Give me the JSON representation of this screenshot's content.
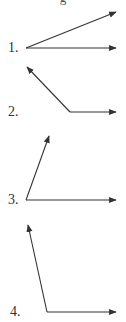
{
  "header": {
    "fragment": "g"
  },
  "diagrams": [
    {
      "label": "1.",
      "label_pos": [
        8,
        41
      ],
      "vertex": [
        26,
        48
      ],
      "ray_a": [
        116,
        12
      ],
      "ray_b": [
        116,
        48
      ]
    },
    {
      "label": "2.",
      "label_pos": [
        8,
        105
      ],
      "vertex": [
        70,
        112
      ],
      "ray_a": [
        27,
        67
      ],
      "ray_b": [
        116,
        112
      ]
    },
    {
      "label": "3.",
      "label_pos": [
        8,
        193
      ],
      "vertex": [
        26,
        200
      ],
      "ray_a": [
        49,
        136
      ],
      "ray_b": [
        116,
        200
      ]
    },
    {
      "label": "4.",
      "label_pos": [
        10,
        305
      ],
      "vertex": [
        47,
        312
      ],
      "ray_a": [
        28,
        225
      ],
      "ray_b": [
        116,
        312
      ]
    }
  ],
  "colors": {
    "stroke": "#333333",
    "background": "#ffffff"
  }
}
